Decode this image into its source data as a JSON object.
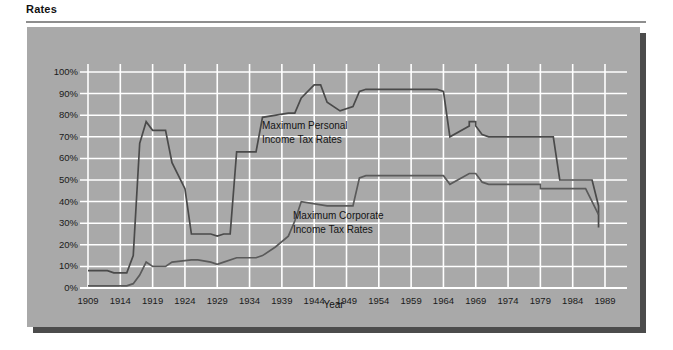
{
  "page": {
    "title": "Rates"
  },
  "chart_data": {
    "type": "line",
    "title": "Rates",
    "xlabel": "Year",
    "ylabel": "",
    "xlim": [
      1909,
      1989
    ],
    "ylim": [
      0,
      100
    ],
    "grid": true,
    "legend_position": "inline-annotation",
    "x_tick_labels": [
      "1909",
      "1914",
      "1919",
      "1924",
      "1929",
      "1934",
      "1939",
      "1944",
      "1949",
      "1954",
      "1959",
      "1964",
      "1969",
      "1974",
      "1979",
      "1984",
      "1989"
    ],
    "y_tick_labels": [
      "0%",
      "10%",
      "20%",
      "30%",
      "40%",
      "50%",
      "60%",
      "70%",
      "80%",
      "90%",
      "100%"
    ],
    "y_tick_values": [
      0,
      10,
      20,
      30,
      40,
      50,
      60,
      70,
      80,
      90,
      100
    ],
    "x_tick_values": [
      1909,
      1914,
      1919,
      1924,
      1929,
      1934,
      1939,
      1944,
      1949,
      1954,
      1959,
      1964,
      1969,
      1974,
      1979,
      1984,
      1989
    ],
    "annotations": [
      {
        "name": "personal",
        "text_line1": "Maximum Personal",
        "text_line2": "Income Tax Rates"
      },
      {
        "name": "corporate",
        "text_line1": "Maximum Corporate",
        "text_line2": "Income Tax Rates"
      }
    ],
    "series": [
      {
        "name": "Maximum Personal Income Tax Rates",
        "color": "#4a4a4a",
        "x": [
          1909,
          1912,
          1913,
          1913,
          1915,
          1916,
          1916,
          1917,
          1917,
          1918,
          1918,
          1919,
          1921,
          1922,
          1922,
          1924,
          1924,
          1925,
          1925,
          1928,
          1929,
          1929,
          1930,
          1931,
          1931,
          1932,
          1932,
          1935,
          1935,
          1936,
          1936,
          1940,
          1940,
          1941,
          1941,
          1942,
          1942,
          1944,
          1944,
          1945,
          1946,
          1946,
          1948,
          1948,
          1950,
          1950,
          1951,
          1951,
          1952,
          1952,
          1954,
          1954,
          1963,
          1964,
          1964,
          1965,
          1965,
          1968,
          1968,
          1969,
          1969,
          1970,
          1970,
          1971,
          1971,
          1981,
          1981,
          1982,
          1982,
          1986,
          1987,
          1987,
          1988,
          1988
        ],
        "y": [
          8,
          8,
          7,
          7,
          7,
          15,
          15,
          67,
          67,
          77,
          77,
          73,
          73,
          58,
          58,
          46,
          46,
          25,
          25,
          25,
          24,
          24,
          25,
          25,
          25,
          63,
          63,
          63,
          63,
          79,
          79,
          81,
          81,
          81,
          81,
          88,
          88,
          94,
          94,
          94,
          86,
          86,
          82,
          82,
          84,
          84,
          91,
          91,
          92,
          92,
          92,
          92,
          92,
          91,
          91,
          70,
          70,
          75,
          77,
          77,
          75,
          71,
          71,
          70,
          70,
          70,
          70,
          50,
          50,
          50,
          50,
          50,
          38,
          28
        ]
      },
      {
        "name": "Maximum Corporate Income Tax Rates",
        "color": "#5a5a5a",
        "x": [
          1909,
          1912,
          1913,
          1915,
          1916,
          1917,
          1918,
          1918,
          1919,
          1921,
          1922,
          1922,
          1925,
          1925,
          1926,
          1928,
          1929,
          1930,
          1932,
          1932,
          1935,
          1936,
          1938,
          1938,
          1940,
          1940,
          1941,
          1941,
          1942,
          1942,
          1946,
          1946,
          1950,
          1950,
          1951,
          1951,
          1952,
          1964,
          1964,
          1965,
          1965,
          1968,
          1968,
          1969,
          1970,
          1970,
          1971,
          1979,
          1979,
          1982,
          1983,
          1984,
          1986,
          1987,
          1987,
          1988
        ],
        "y": [
          1,
          1,
          1,
          1,
          2,
          6,
          12,
          12,
          10,
          10,
          12,
          12,
          13,
          13,
          13,
          12,
          11,
          12,
          14,
          14,
          14,
          15,
          19,
          19,
          24,
          24,
          31,
          31,
          40,
          40,
          38,
          38,
          38,
          38,
          51,
          51,
          52,
          52,
          52,
          48,
          48,
          53,
          53,
          53,
          49,
          49,
          48,
          48,
          46,
          46,
          46,
          46,
          46,
          40,
          40,
          34
        ]
      }
    ]
  }
}
